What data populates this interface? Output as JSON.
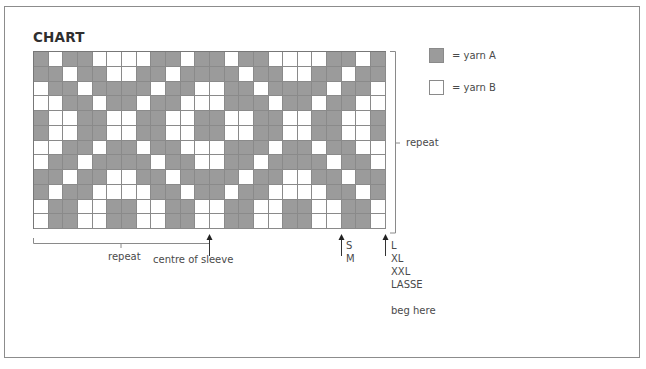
{
  "title": "CHART",
  "legend": [
    {
      "label": "= yarn A",
      "color": "#9b9b9b",
      "symbol": "filled-square"
    },
    {
      "label": "= yarn B",
      "color": "#ffffff",
      "symbol": "empty-square"
    }
  ],
  "grid": {
    "columns": 24,
    "rows_count": 12,
    "key": {
      "A": "yarn A (grey)",
      "B": "yarn B (white)"
    },
    "rows": [
      "ABAABBBBAABAABAABBBBAABA",
      "AABAABBAABAAAABAABBAABAA",
      "BAABAAAABAABBAABAAAABAAB",
      "BBAABAABAABBBAAABAABAABB",
      "ABBAABBAABBAABBAABBAABBA",
      "ABBAABBAABBAABBAABBAABBA",
      "BBAABAABAABBBAAABAABAABB",
      "BAABAAAABAABBAABAAAABAAB",
      "AABAABBAABAAAABAABBAABAA",
      "ABAABBBBAABAABAABBBBAABA",
      "BAABBAABBAABBAABBAABBAAB",
      "BAABBAABBAABBAABBAABBAAB"
    ]
  },
  "annotations": {
    "vertical_repeat": "repeat",
    "horizontal_repeat": "repeat",
    "centre": "centre of sleeve",
    "size_marker_1": [
      "S",
      "M"
    ],
    "size_marker_2": [
      "L",
      "XL",
      "XXL",
      "LASSE"
    ],
    "begin": "beg here"
  },
  "colors": {
    "yarn_a": "#9b9b9b",
    "yarn_b": "#ffffff",
    "lines": "#8a8a8a",
    "frame": "#8c8c8c"
  }
}
